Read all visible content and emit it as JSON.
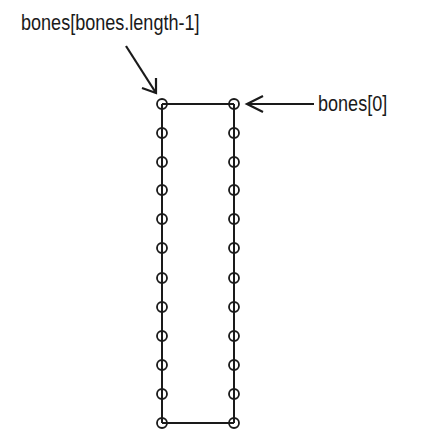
{
  "diagram": {
    "labels": {
      "last_bone": "bones[bones.length-1]",
      "first_bone": "bones[0]"
    },
    "columns_x": [
      162,
      234
    ],
    "joint_y": [
      104,
      133,
      162,
      190,
      219,
      248,
      278,
      307,
      336,
      365,
      394,
      423
    ],
    "joint_radius": 5,
    "stroke_color": "#1a1a1a"
  }
}
